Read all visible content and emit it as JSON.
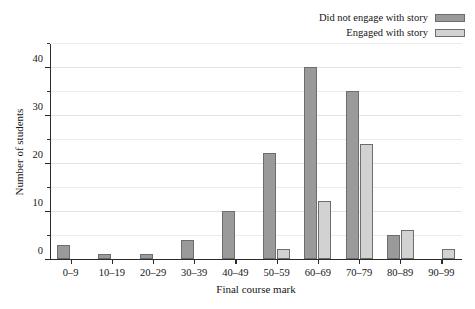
{
  "chart_data": {
    "type": "bar",
    "title": "",
    "subtitle": "",
    "xlabel": "Final course mark",
    "ylabel": "Number of students",
    "categories": [
      "0–9",
      "10–19",
      "20–29",
      "30–39",
      "40–49",
      "50–59",
      "60–69",
      "70–79",
      "80–89",
      "90–99"
    ],
    "series": [
      {
        "name": "Did not engage with story",
        "color": "#9a9a9a",
        "border_color": "#6d6d6d",
        "values": [
          3,
          1,
          1,
          4,
          10,
          22,
          40,
          35,
          5,
          0
        ]
      },
      {
        "name": "Engaged with story",
        "color": "#d2d2d2",
        "border_color": "#6d6d6d",
        "values": [
          0,
          0,
          0,
          0,
          0,
          2,
          12,
          24,
          6,
          2
        ]
      }
    ],
    "ylim": [
      0,
      45
    ],
    "yticks": [
      0,
      10,
      20,
      30,
      40
    ],
    "ytick_labels": [
      "0",
      "10",
      "20",
      "30",
      "40"
    ],
    "yminorticks": [
      5,
      15,
      25,
      35,
      45
    ],
    "grid": true,
    "grid_axis": "y",
    "legend_position": "top-right",
    "legend_label_align": "right",
    "background_color": "#ffffff",
    "axis_color": "#2b2b2b",
    "gridline_color": "#ececec"
  }
}
